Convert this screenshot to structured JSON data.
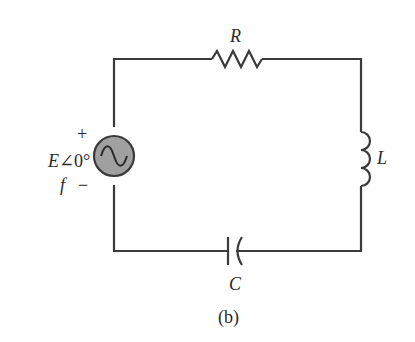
{
  "diagram": {
    "type": "series RLC circuit",
    "caption": "(b)",
    "source": {
      "label": "E∠0°",
      "frequency_label": "f",
      "plus": "+",
      "minus": "−",
      "fill_color": "#a0a0a0"
    },
    "components": {
      "resistor": {
        "label": "R"
      },
      "inductor": {
        "label": "L"
      },
      "capacitor": {
        "label": "C"
      }
    }
  }
}
